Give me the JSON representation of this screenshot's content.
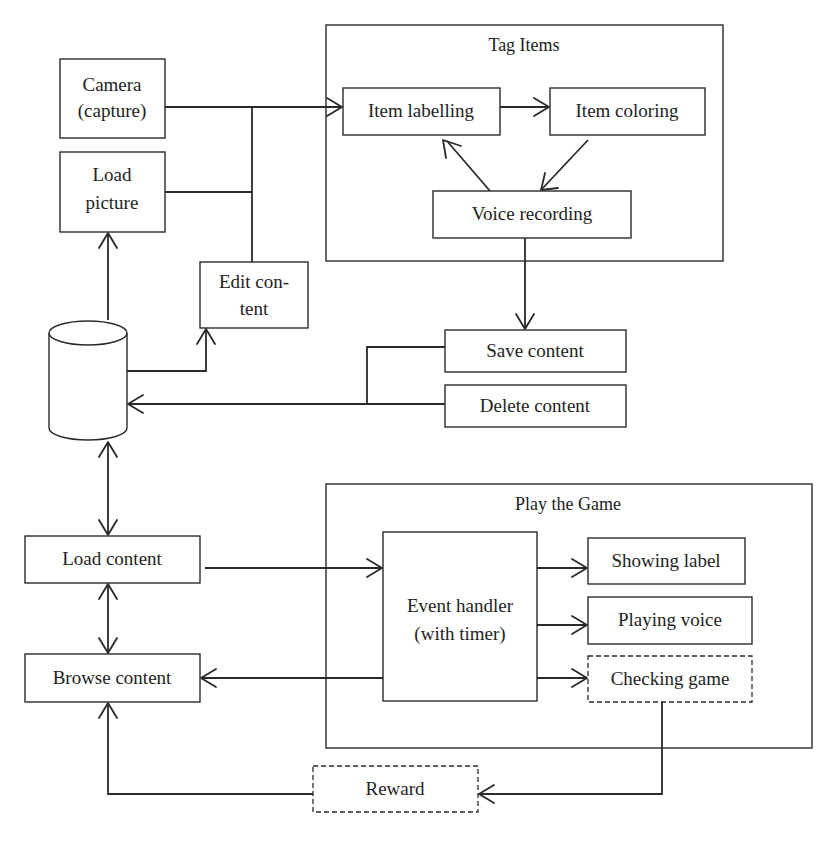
{
  "diagram": {
    "containers": {
      "tag_items": {
        "title": "Tag Items"
      },
      "play_game": {
        "title": "Play the Game"
      }
    },
    "nodes": {
      "camera": {
        "line1": "Camera",
        "line2": "(capture)"
      },
      "load_picture": {
        "line1": "Load",
        "line2": "picture"
      },
      "edit_content": {
        "line1": "Edit con-",
        "line2": "tent"
      },
      "item_labelling": {
        "label": "Item labelling"
      },
      "item_coloring": {
        "label": "Item coloring"
      },
      "voice_recording": {
        "label": "Voice recording"
      },
      "database": {
        "label": ""
      },
      "save_content": {
        "label": "Save content"
      },
      "delete_content": {
        "label": "Delete content"
      },
      "load_content": {
        "label": "Load content"
      },
      "browse_content": {
        "label": "Browse content"
      },
      "event_handler": {
        "line1": "Event handler",
        "line2": "(with timer)"
      },
      "showing_label": {
        "label": "Showing label"
      },
      "playing_voice": {
        "label": "Playing voice"
      },
      "checking_game": {
        "label": "Checking game",
        "style": "dashed"
      },
      "reward": {
        "label": "Reward",
        "style": "dashed"
      }
    },
    "edges": [
      {
        "from": "camera",
        "to": "item_labelling"
      },
      {
        "from": "load_picture",
        "to": "item_labelling"
      },
      {
        "from": "edit_content",
        "to": "item_labelling"
      },
      {
        "from": "item_labelling",
        "to": "item_coloring"
      },
      {
        "from": "item_coloring",
        "to": "voice_recording"
      },
      {
        "from": "voice_recording",
        "to": "item_labelling"
      },
      {
        "from": "voice_recording",
        "to": "save_content"
      },
      {
        "from": "database",
        "to": "load_picture"
      },
      {
        "from": "database",
        "to": "edit_content"
      },
      {
        "from": "save_content",
        "to": "database"
      },
      {
        "from": "delete_content",
        "to": "database"
      },
      {
        "from": "database",
        "to": "load_content",
        "bidirectional": true
      },
      {
        "from": "load_content",
        "to": "browse_content",
        "bidirectional": true
      },
      {
        "from": "load_content",
        "to": "event_handler"
      },
      {
        "from": "event_handler",
        "to": "browse_content"
      },
      {
        "from": "event_handler",
        "to": "showing_label"
      },
      {
        "from": "event_handler",
        "to": "playing_voice"
      },
      {
        "from": "event_handler",
        "to": "checking_game"
      },
      {
        "from": "checking_game",
        "to": "reward"
      },
      {
        "from": "reward",
        "to": "browse_content"
      }
    ]
  }
}
